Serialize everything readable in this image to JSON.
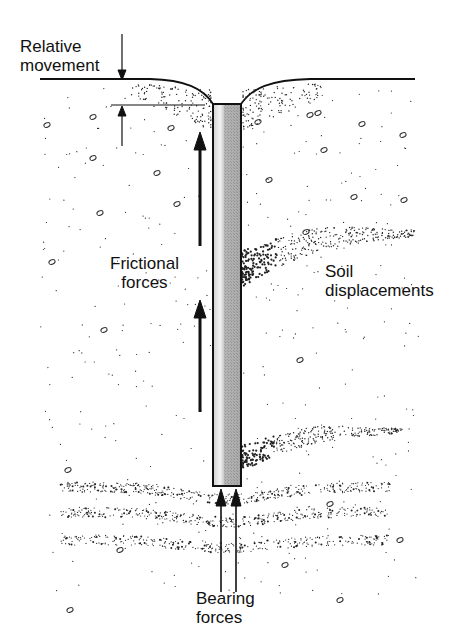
{
  "diagram": {
    "labels": {
      "relative_movement": [
        "Relative",
        "movement"
      ],
      "frictional_forces": [
        "Frictional",
        "forces"
      ],
      "soil_displacements": [
        "Soil",
        "displacements"
      ],
      "bearing_forces": [
        "Bearing",
        "forces"
      ]
    },
    "colors": {
      "ink": "#111111",
      "pile_fill": "#a8a8a8",
      "pile_highlight": "#e6e6e6",
      "background": "#ffffff"
    }
  }
}
